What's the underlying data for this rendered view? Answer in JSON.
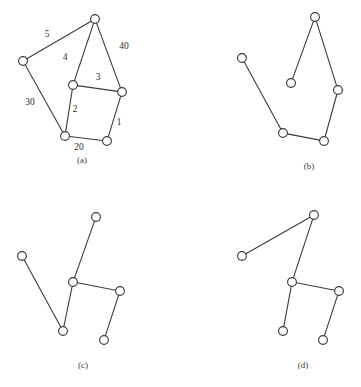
{
  "figure": {
    "width": 361,
    "height": 387,
    "background_color": "#ffffff",
    "stroke_color": "#3b3b3b",
    "node_fill_color": "#ffffff",
    "text_color": "#2e2e2e",
    "node_radius": 4.4
  },
  "panels": [
    {
      "id": "a",
      "caption": "(a)",
      "caption_pos": {
        "x": 82,
        "y": 161
      },
      "nodes": [
        {
          "name": "a-node-top",
          "x": 95,
          "y": 19
        },
        {
          "name": "a-node-left",
          "x": 23,
          "y": 61
        },
        {
          "name": "a-node-mid-left",
          "x": 73,
          "y": 85
        },
        {
          "name": "a-node-mid-right",
          "x": 122,
          "y": 92
        },
        {
          "name": "a-node-bottom-left",
          "x": 65,
          "y": 136
        },
        {
          "name": "a-node-bottom-right",
          "x": 107,
          "y": 141
        }
      ],
      "edges": [
        {
          "name": "a-edge-5",
          "from": 1,
          "to": 0,
          "weight": "5",
          "label_pos": {
            "x": 47,
            "y": 35
          }
        },
        {
          "name": "a-edge-40",
          "from": 0,
          "to": 3,
          "weight": "40",
          "label_pos": {
            "x": 124,
            "y": 47
          }
        },
        {
          "name": "a-edge-4",
          "from": 0,
          "to": 2,
          "weight": "4",
          "label_pos": {
            "x": 65,
            "y": 58
          }
        },
        {
          "name": "a-edge-3",
          "from": 2,
          "to": 3,
          "weight": "3",
          "label_pos": {
            "x": 98,
            "y": 78
          }
        },
        {
          "name": "a-edge-30",
          "from": 1,
          "to": 4,
          "weight": "30",
          "label_pos": {
            "x": 30,
            "y": 103
          }
        },
        {
          "name": "a-edge-2",
          "from": 2,
          "to": 4,
          "weight": "2",
          "label_pos": {
            "x": 75,
            "y": 110
          }
        },
        {
          "name": "a-edge-1",
          "from": 3,
          "to": 5,
          "weight": "1",
          "label_pos": {
            "x": 119,
            "y": 123
          }
        },
        {
          "name": "a-edge-20",
          "from": 4,
          "to": 5,
          "weight": "20",
          "label_pos": {
            "x": 79,
            "y": 148
          }
        }
      ]
    },
    {
      "id": "b",
      "caption": "(b)",
      "caption_pos": {
        "x": 309,
        "y": 167
      },
      "nodes": [
        {
          "name": "b-node-top",
          "x": 315,
          "y": 17
        },
        {
          "name": "b-node-left",
          "x": 242,
          "y": 58
        },
        {
          "name": "b-node-inner",
          "x": 291,
          "y": 83
        },
        {
          "name": "b-node-right",
          "x": 338,
          "y": 90
        },
        {
          "name": "b-node-bottom-left",
          "x": 283,
          "y": 133
        },
        {
          "name": "b-node-bottom-right",
          "x": 324,
          "y": 141
        }
      ],
      "edges": [
        {
          "name": "b-edge-top-inner",
          "from": 0,
          "to": 2,
          "weight": "",
          "label_pos": null
        },
        {
          "name": "b-edge-top-right",
          "from": 0,
          "to": 3,
          "weight": "",
          "label_pos": null
        },
        {
          "name": "b-edge-left-bottomleft",
          "from": 1,
          "to": 4,
          "weight": "",
          "label_pos": null
        },
        {
          "name": "b-edge-bottomleft-bottomright",
          "from": 4,
          "to": 5,
          "weight": "",
          "label_pos": null
        },
        {
          "name": "b-edge-bottomright-right",
          "from": 5,
          "to": 3,
          "weight": "",
          "label_pos": null
        }
      ]
    },
    {
      "id": "c",
      "caption": "(c)",
      "caption_pos": {
        "x": 83,
        "y": 366
      },
      "nodes": [
        {
          "name": "c-node-top",
          "x": 96,
          "y": 217
        },
        {
          "name": "c-node-left",
          "x": 22,
          "y": 256
        },
        {
          "name": "c-node-center",
          "x": 73,
          "y": 282
        },
        {
          "name": "c-node-right",
          "x": 120,
          "y": 291
        },
        {
          "name": "c-node-bottom-left",
          "x": 63,
          "y": 331
        },
        {
          "name": "c-node-bottom-right",
          "x": 104,
          "y": 340
        }
      ],
      "edges": [
        {
          "name": "c-edge-top-center",
          "from": 0,
          "to": 2,
          "weight": "",
          "label_pos": null
        },
        {
          "name": "c-edge-left-bottomleft",
          "from": 1,
          "to": 4,
          "weight": "",
          "label_pos": null
        },
        {
          "name": "c-edge-center-bottomleft",
          "from": 2,
          "to": 4,
          "weight": "",
          "label_pos": null
        },
        {
          "name": "c-edge-center-right",
          "from": 2,
          "to": 3,
          "weight": "",
          "label_pos": null
        },
        {
          "name": "c-edge-right-bottomright",
          "from": 3,
          "to": 5,
          "weight": "",
          "label_pos": null
        }
      ]
    },
    {
      "id": "d",
      "caption": "(d)",
      "caption_pos": {
        "x": 303,
        "y": 366
      },
      "nodes": [
        {
          "name": "d-node-top",
          "x": 314,
          "y": 215
        },
        {
          "name": "d-node-left",
          "x": 242,
          "y": 256
        },
        {
          "name": "d-node-center",
          "x": 292,
          "y": 282
        },
        {
          "name": "d-node-right",
          "x": 339,
          "y": 291
        },
        {
          "name": "d-node-bottom-left",
          "x": 283,
          "y": 331
        },
        {
          "name": "d-node-bottom-right",
          "x": 323,
          "y": 340
        }
      ],
      "edges": [
        {
          "name": "d-edge-left-top",
          "from": 1,
          "to": 0,
          "weight": "",
          "label_pos": null
        },
        {
          "name": "d-edge-top-center",
          "from": 0,
          "to": 2,
          "weight": "",
          "label_pos": null
        },
        {
          "name": "d-edge-center-bottomleft",
          "from": 2,
          "to": 4,
          "weight": "",
          "label_pos": null
        },
        {
          "name": "d-edge-center-right",
          "from": 2,
          "to": 3,
          "weight": "",
          "label_pos": null
        },
        {
          "name": "d-edge-right-bottomright",
          "from": 3,
          "to": 5,
          "weight": "",
          "label_pos": null
        }
      ]
    }
  ]
}
